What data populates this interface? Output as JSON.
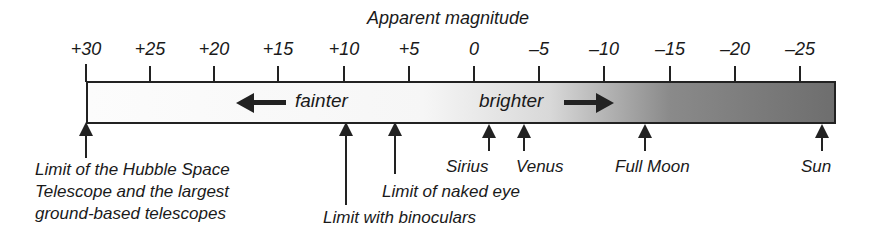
{
  "diagram": {
    "title": "Apparent magnitude",
    "scale": {
      "ticks": [
        {
          "label": "+30",
          "value": 30,
          "x": 86
        },
        {
          "label": "+25",
          "value": 25,
          "x": 150
        },
        {
          "label": "+20",
          "value": 20,
          "x": 214
        },
        {
          "label": "+15",
          "value": 15,
          "x": 278
        },
        {
          "label": "+10",
          "value": 10,
          "x": 344
        },
        {
          "label": "+5",
          "value": 5,
          "x": 409
        },
        {
          "label": "0",
          "value": 0,
          "x": 474
        },
        {
          "label": "–5",
          "value": -5,
          "x": 539
        },
        {
          "label": "–10",
          "value": -10,
          "x": 604
        },
        {
          "label": "–15",
          "value": -15,
          "x": 670
        },
        {
          "label": "–20",
          "value": -20,
          "x": 735
        },
        {
          "label": "–25",
          "value": -25,
          "x": 800
        }
      ],
      "fainter_label": "fainter",
      "brighter_label": "brighter",
      "gradient_colors": [
        "#fcfcfc",
        "#f6f6f6",
        "#d8d8d8",
        "#8a8a8a",
        "#6e6e6e"
      ]
    },
    "annotations": [
      {
        "id": "hubble",
        "lines": [
          "Limit of the Hubble Space",
          "Telescope and the largest",
          "ground-based telescopes"
        ],
        "magnitude": 30
      },
      {
        "id": "binoculars",
        "lines": [
          "Limit with binoculars"
        ],
        "magnitude": 10
      },
      {
        "id": "naked-eye",
        "lines": [
          "Limit of naked eye"
        ],
        "magnitude": 6
      },
      {
        "id": "sirius",
        "lines": [
          "Sirius"
        ],
        "magnitude": -1.5
      },
      {
        "id": "venus",
        "lines": [
          "Venus"
        ],
        "magnitude": -4
      },
      {
        "id": "full-moon",
        "lines": [
          "Full Moon"
        ],
        "magnitude": -12.5
      },
      {
        "id": "sun",
        "lines": [
          "Sun"
        ],
        "magnitude": -26.7
      }
    ]
  }
}
